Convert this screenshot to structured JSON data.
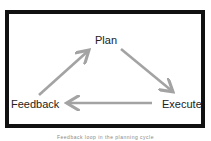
{
  "diagram": {
    "type": "cycle",
    "nodes": [
      {
        "id": "plan",
        "label": "Plan"
      },
      {
        "id": "execute",
        "label": "Execute"
      },
      {
        "id": "feedback",
        "label": "Feedback"
      }
    ],
    "edges": [
      {
        "from": "plan",
        "to": "execute"
      },
      {
        "from": "execute",
        "to": "feedback"
      },
      {
        "from": "feedback",
        "to": "plan"
      }
    ],
    "colors": {
      "frame_border": "#111111",
      "arrow": "#a3a3a3",
      "text": "#222222",
      "caption": "#888888"
    }
  },
  "caption": "Feedback loop in the planning cycle"
}
